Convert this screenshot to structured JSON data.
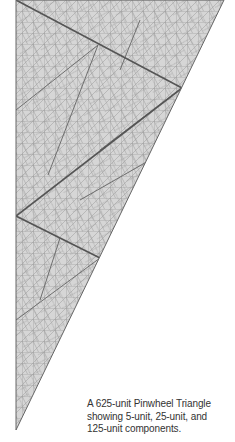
{
  "figure": {
    "title": "625-unit Pinwheel Triangle",
    "fill_color": "#d4d4d4",
    "minor_line_color": "#8a8a8a",
    "major_line_color": "#555555"
  },
  "caption": {
    "lines": [
      "A 625-unit Pinwheel Triangle",
      "showing 5-unit, 25-unit, and",
      "125-unit components."
    ]
  }
}
